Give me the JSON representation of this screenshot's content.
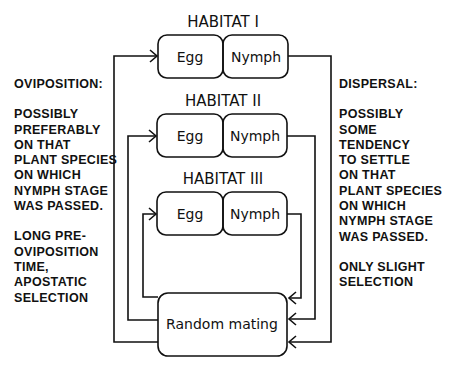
{
  "diagram": {
    "habitats": [
      {
        "label": "HABITAT I",
        "egg": "Egg",
        "nymph": "Nymph"
      },
      {
        "label": "HABITAT II",
        "egg": "Egg",
        "nymph": "Nymph"
      },
      {
        "label": "HABITAT III",
        "egg": "Egg",
        "nymph": "Nymph"
      }
    ],
    "mating_box": "Random mating",
    "left_panel": {
      "title": "OVIPOSITION:",
      "para1": [
        "POSSIBLY",
        "PREFERABLY",
        "ON THAT",
        "PLANT SPECIES",
        "ON WHICH",
        "NYMPH STAGE",
        "WAS PASSED."
      ],
      "para2": [
        "LONG PRE-",
        "OVIPOSITION",
        "TIME,",
        "APOSTATIC",
        "SELECTION"
      ]
    },
    "right_panel": {
      "title": "DISPERSAL:",
      "para1": [
        "POSSIBLY",
        "SOME TENDENCY",
        "TO SETTLE",
        "ON THAT",
        "PLANT SPECIES",
        "ON WHICH",
        "NYMPH STAGE",
        "WAS PASSED."
      ],
      "para2": [
        "ONLY SLIGHT",
        "SELECTION"
      ]
    }
  }
}
